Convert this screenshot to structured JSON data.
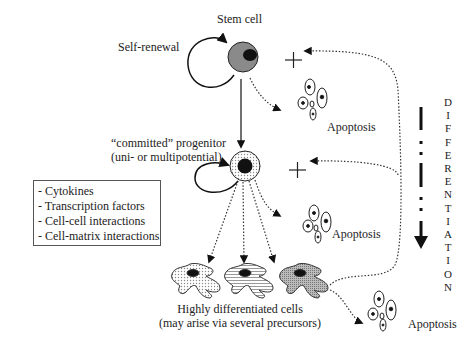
{
  "diagram": {
    "nodes": {
      "stem_cell": {
        "label": "Stem cell"
      },
      "self_renewal": {
        "label": "Self-renewal"
      },
      "progenitor": {
        "label_line1": "“committed” progenitor",
        "label_line2": "(uni- or multipotential)"
      },
      "differentiated": {
        "label_line1": "Highly differentiated cells",
        "label_line2": "(may arise via several precursors)"
      },
      "apoptosis_1": {
        "label": "Apoptosis"
      },
      "apoptosis_2": {
        "label": "Apoptosis"
      },
      "apoptosis_3": {
        "label": "Apoptosis"
      }
    },
    "factors_box": {
      "items": [
        "- Cytokines",
        "- Transcription factors",
        "- Cell-cell interactions",
        "- Cell-matrix interactions"
      ]
    },
    "axis": {
      "label": "DIFFERENTIATION",
      "letters": [
        "D",
        "I",
        "F",
        "F",
        "E",
        "R",
        "E",
        "N",
        "T",
        "I",
        "A",
        "T",
        "I",
        "O",
        "N"
      ]
    },
    "symbols": {
      "plus": "+"
    },
    "colors": {
      "ink": "#222222",
      "stem_fill": "#8a8a8a",
      "nucleus": "#111111"
    }
  }
}
